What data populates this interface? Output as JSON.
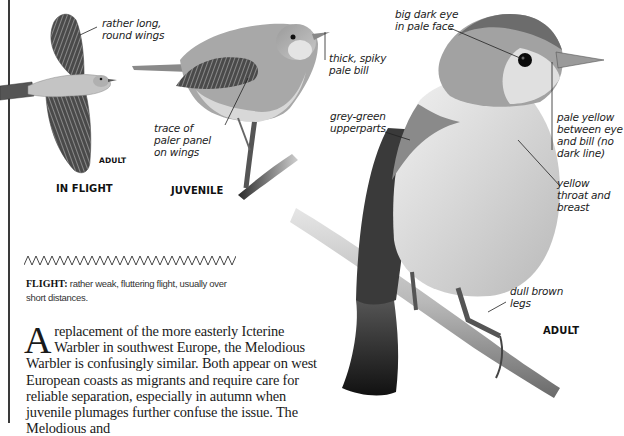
{
  "page": {
    "background": "#ffffff",
    "rule_color": "#3a3a3a"
  },
  "illustrations": {
    "in_flight": {
      "caption": "IN FLIGHT",
      "sub_caption": "ADULT",
      "annotations": [
        {
          "id": "wings",
          "text": "rather long,\nround wings"
        }
      ]
    },
    "juvenile": {
      "caption": "JUVENILE",
      "annotations": [
        {
          "id": "panel",
          "text": "trace of\npaler panel\non wings"
        },
        {
          "id": "bill",
          "text": "thick, spiky\npale bill"
        }
      ]
    },
    "adult": {
      "caption": "ADULT",
      "annotations": [
        {
          "id": "eye",
          "text": "big dark eye\nin pale face"
        },
        {
          "id": "upperparts",
          "text": "grey-green\nupperparts"
        },
        {
          "id": "lores",
          "text": "pale yellow\nbetween eye\nand bill (no\ndark line)"
        },
        {
          "id": "throat",
          "text": "yellow\nthroat and\nbreast"
        },
        {
          "id": "legs",
          "text": "dull brown\nlegs"
        }
      ]
    }
  },
  "flight_note": {
    "label": "FLIGHT:",
    "text": " rather weak, fluttering flight, usually over short distances."
  },
  "body": {
    "dropcap": "A",
    "text": "replacement of the more easterly Icterine Warbler in southwest Europe, the Melodious Warbler is confusingly similar. Both appear on west European coasts as migrants and require care for reliable separation, especially in autumn when juvenile plumages further confuse the issue. The Melodious and"
  }
}
